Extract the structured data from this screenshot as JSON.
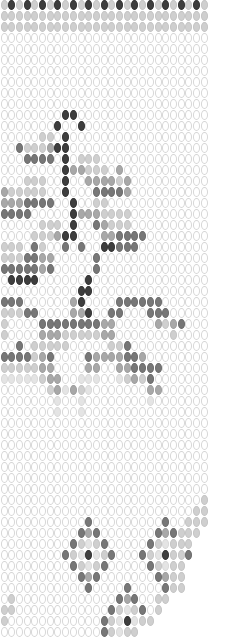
{
  "pattern": {
    "title": "Bead pattern with tree and diamond motifs",
    "columns": 27,
    "pitch_x": 7.7,
    "pitch_y": 11,
    "origin_x": 0.5,
    "origin_y": 0,
    "legend": {
      ".": "white",
      "x": "very light gray",
      "l": "light gray",
      "m": "medium gray",
      "d": "dark gray",
      "k": "near black",
      " ": "empty"
    },
    "colors": {
      "white": "#ffffff",
      "outline": "#d6d6d6",
      "very_light": "#e4e4e4",
      "light": "#cfcfcf",
      "medium": "#a8a8a8",
      "dark": "#777777",
      "black": "#3e3e3e"
    },
    "rows": [
      "lklklklklklklklklklklklklkl",
      "lllllllllllllllllllllllllll",
      "lllllllllllllllllllllllllll",
      "...........................",
      "...........................",
      "...........................",
      "...........................",
      "...........................",
      "...........................",
      "...........................",
      "........kk.................",
      ".......k..k................",
      ".....ll.k..................",
      "..dlllmkk..................",
      "...dddd.k.lll..............",
      "........kmmlll.m...........",
      "...lll..k..mmmmlm..........",
      "mlllll..k...ddddm..........",
      "mmmdddd..k..ll.............",
      "dddd.....kmmmllll..........",
      ".....lll.k..dmlll..........",
      "....lllmkk...mmdddd........",
      "lll.dl..d.d..kkddd.........",
      "lllddmm.....d..............",
      "dddddmd.....d..............",
      ".kkkk......k...............",
      "..........kk...............",
      "ddd......mk....dddddd......",
      "llldd....mmk..dd...ddd.....",
      "l....ddddddddmm.....mlmd...",
      "l....mmmlllllmm.......l....",
      "..d.lllll.....lld..........",
      "ddddlmd....dmmmmddm........",
      "lllllmm....mm..mmdddd......",
      "xxxxxlmm..xxx..xlmld.......",
      "......lmxmlx.......mm......",
      ".......x..x........x.......",
      ".......x..x................",
      "...........................",
      "...........................",
      "...........................",
      "...........................",
      "...........................",
      "...........................",
      "...........................",
      "..........................l",
      ".........................ll",
      "...........d.........d..lll",
      "..........dmd.......dmdlll ",
      ".........dlxld.....dlxlll  ",
      "........dlxkxld...dlxklld  ",
      ".........dlxld.....dlxll   ",
      "..........dmd.......dmll   ",
      "...........d....d....dll   ",
      ".l.............dmd..ll     ",
      "ll............dlxld.l      ",
      "l............dlxkxll       ",
      ".............dlxll         "
    ]
  }
}
